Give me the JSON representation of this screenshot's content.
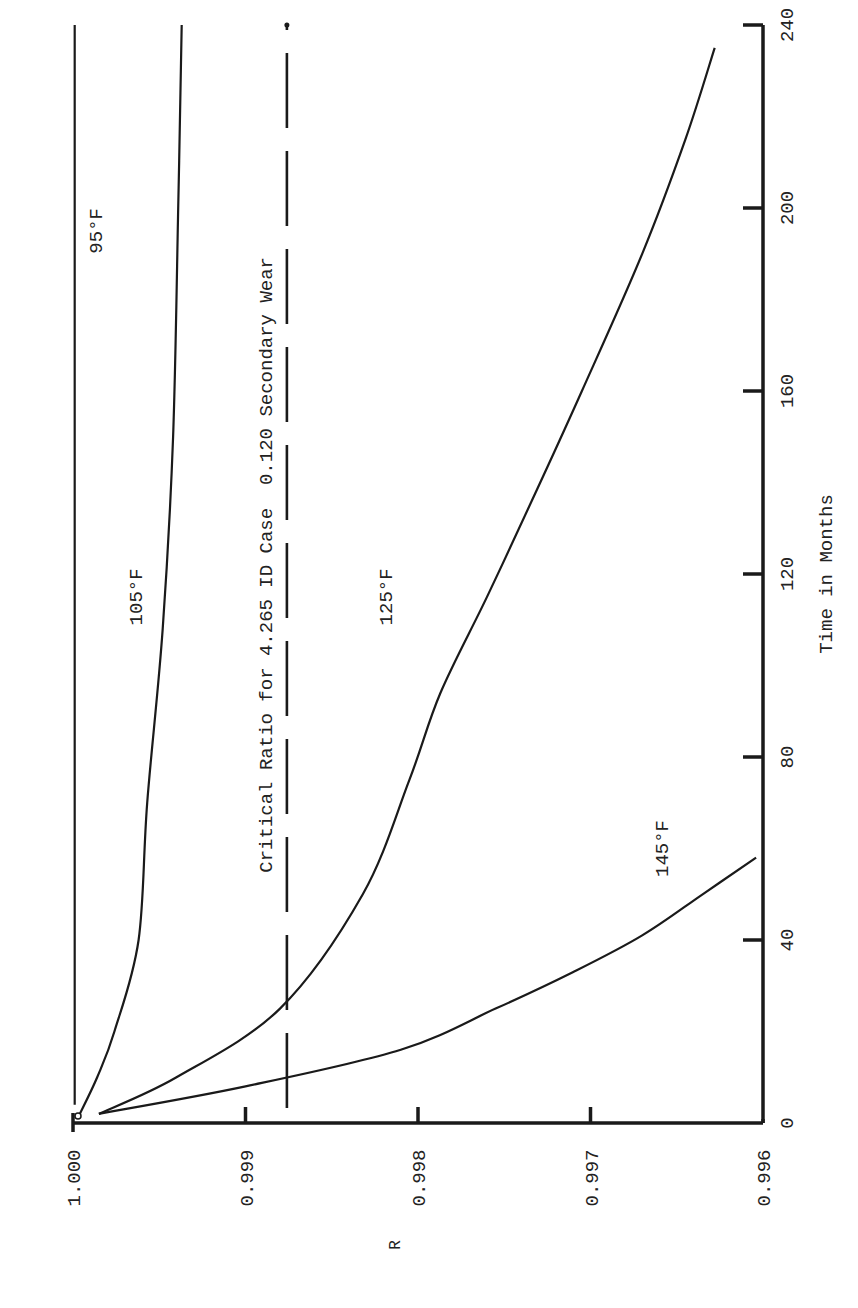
{
  "chart_data": {
    "type": "line",
    "orientation": "rotated-90-ccw",
    "title": "",
    "xlabel": "Time in Months",
    "ylabel": "R",
    "xlim": [
      0,
      240
    ],
    "ylim": [
      0.996,
      1.0
    ],
    "x_ticks": [
      0,
      40,
      80,
      120,
      160,
      200,
      240
    ],
    "x_tick_labels": [
      "0",
      "40",
      "80",
      "120",
      "160",
      "200",
      "240"
    ],
    "y_ticks": [
      1.0,
      0.999,
      0.998,
      0.997,
      0.996
    ],
    "y_tick_labels": [
      "1.000",
      "0.999",
      "0.998",
      "0.997",
      "0.996"
    ],
    "grid": false,
    "series": [
      {
        "name": "95°F",
        "label": "95°F",
        "x": [
          4,
          60,
          120,
          180,
          240
        ],
        "y": [
          0.99999,
          0.99999,
          0.99999,
          0.99999,
          0.99999
        ]
      },
      {
        "name": "105°F",
        "label": "105°F",
        "x": [
          2,
          10,
          20,
          40,
          70,
          108,
          150,
          200,
          240
        ],
        "y": [
          0.99996,
          0.99986,
          0.99976,
          0.99962,
          0.99957,
          0.99948,
          0.99942,
          0.99939,
          0.99937
        ]
      },
      {
        "name": "125°F",
        "label": "125°F",
        "x": [
          2,
          10,
          25,
          50,
          75,
          94,
          115,
          136,
          160,
          190,
          215,
          235
        ],
        "y": [
          0.99985,
          0.9994,
          0.9988,
          0.99832,
          0.99805,
          0.99787,
          0.9976,
          0.99734,
          0.99705,
          0.9967,
          0.99645,
          0.99628
        ]
      },
      {
        "name": "145°F",
        "label": "145°F",
        "x": [
          2,
          8,
          16,
          25,
          33,
          41,
          50,
          58
        ],
        "y": [
          0.99985,
          0.999,
          0.9981,
          0.99755,
          0.9971,
          0.9967,
          0.99635,
          0.99604
        ]
      }
    ],
    "reference_line": {
      "label": "Critical Ratio for 4.265 ID Case  0.120 Secondary Wear",
      "y": 0.99876,
      "style": "dashed",
      "x_range": [
        0,
        240
      ]
    },
    "annotations": [
      {
        "text": "95°F",
        "x": 195,
        "y": 0.99983
      },
      {
        "text": "105°F",
        "x": 115,
        "y": 0.9996
      },
      {
        "text": "125°F",
        "x": 115,
        "y": 0.99815
      },
      {
        "text": "145°F",
        "x": 60,
        "y": 0.99655
      }
    ]
  }
}
